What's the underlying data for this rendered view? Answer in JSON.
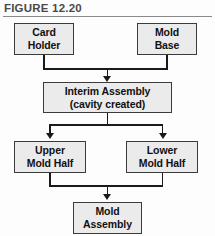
{
  "figure": {
    "label": "FIGURE 12.20"
  },
  "chart_data": {
    "type": "diagram",
    "diagram_type": "flowchart",
    "title": "FIGURE 12.20",
    "orientation": "top-to-bottom",
    "nodes": [
      {
        "id": "card_holder",
        "label_line1": "Card",
        "label_line2": "Holder",
        "level": 1,
        "column": "left"
      },
      {
        "id": "mold_base",
        "label_line1": "Mold",
        "label_line2": "Base",
        "level": 1,
        "column": "right"
      },
      {
        "id": "interim",
        "label_line1": "Interim Assembly",
        "label_line2": "(cavity created)",
        "level": 2,
        "column": "center"
      },
      {
        "id": "upper_half",
        "label_line1": "Upper",
        "label_line2": "Mold Half",
        "level": 3,
        "column": "left"
      },
      {
        "id": "lower_half",
        "label_line1": "Lower",
        "label_line2": "Mold Half",
        "level": 3,
        "column": "right"
      },
      {
        "id": "mold_assembly",
        "label_line1": "Mold",
        "label_line2": "Assembly",
        "level": 4,
        "column": "center"
      }
    ],
    "edges": [
      {
        "from": "card_holder",
        "to": "interim",
        "style": "merge",
        "arrow": true
      },
      {
        "from": "mold_base",
        "to": "interim",
        "style": "merge",
        "arrow": true
      },
      {
        "from": "interim",
        "to": "upper_half",
        "style": "split",
        "arrow": true
      },
      {
        "from": "interim",
        "to": "lower_half",
        "style": "split",
        "arrow": true
      },
      {
        "from": "upper_half",
        "to": "mold_assembly",
        "style": "merge",
        "arrow": true
      },
      {
        "from": "lower_half",
        "to": "mold_assembly",
        "style": "merge",
        "arrow": true
      }
    ],
    "colors": {
      "node_fill": "#ebebeb",
      "node_border": "#3b3b3b",
      "connector": "#1a1a1a",
      "caption_text": "#4a4a4a",
      "rule": "#8a8a8a",
      "background": "#fdfdfd"
    }
  }
}
